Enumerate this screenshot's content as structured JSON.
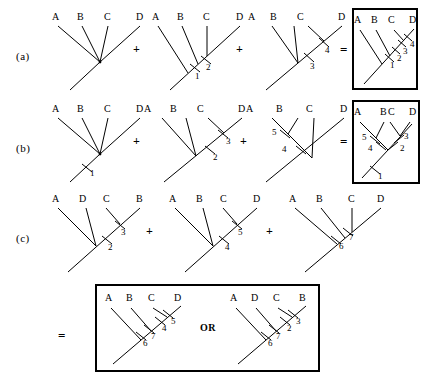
{
  "figure": {
    "rows": [
      {
        "id": "a",
        "label": "(a)",
        "operators": [
          "+",
          "+",
          "="
        ],
        "trees": [
          {
            "name": "row-a-tree-1",
            "leaves": [
              "A",
              "B",
              "C",
              "D"
            ],
            "marks": [],
            "boxed": false
          },
          {
            "name": "row-a-tree-2",
            "leaves": [
              "A",
              "B",
              "C",
              "D"
            ],
            "marks": [
              "1",
              "2"
            ],
            "boxed": false
          },
          {
            "name": "row-a-tree-3",
            "leaves": [
              "A",
              "B",
              "C",
              "D"
            ],
            "marks": [
              "3",
              "4"
            ],
            "boxed": false
          },
          {
            "name": "row-a-result",
            "leaves": [
              "A",
              "B",
              "C",
              "D"
            ],
            "marks": [
              "1",
              "2",
              "3",
              "4"
            ],
            "boxed": true
          }
        ]
      },
      {
        "id": "b",
        "label": "(b)",
        "operators": [
          "+",
          "+",
          "="
        ],
        "trees": [
          {
            "name": "row-b-tree-1",
            "leaves": [
              "A",
              "B",
              "C",
              "D"
            ],
            "marks": [
              "1"
            ],
            "boxed": false
          },
          {
            "name": "row-b-tree-2",
            "leaves": [
              "A",
              "B",
              "C",
              "D"
            ],
            "marks": [
              "2",
              "3"
            ],
            "boxed": false
          },
          {
            "name": "row-b-tree-3",
            "leaves": [
              "A",
              "B",
              "C",
              "D"
            ],
            "marks": [
              "4",
              "5"
            ],
            "boxed": false
          },
          {
            "name": "row-b-result",
            "leaves": [
              "A",
              "B",
              "C",
              "D"
            ],
            "marks": [
              "1",
              "2",
              "3",
              "4",
              "5"
            ],
            "boxed": true
          }
        ]
      },
      {
        "id": "c",
        "label": "(c)",
        "operators": [
          "+",
          "+"
        ],
        "trees": [
          {
            "name": "row-c-tree-1",
            "leaves": [
              "A",
              "D",
              "C",
              "B"
            ],
            "marks": [
              "2",
              "3"
            ],
            "boxed": false
          },
          {
            "name": "row-c-tree-2",
            "leaves": [
              "A",
              "B",
              "C",
              "D"
            ],
            "marks": [
              "4",
              "5"
            ],
            "boxed": false
          },
          {
            "name": "row-c-tree-3",
            "leaves": [
              "A",
              "B",
              "C",
              "D"
            ],
            "marks": [
              "6",
              "7"
            ],
            "boxed": false
          }
        ]
      }
    ],
    "result_row": {
      "id": "c-result",
      "operator": "=",
      "or_text": "OR",
      "trees": [
        {
          "name": "result-tree-left",
          "leaves": [
            "A",
            "B",
            "C",
            "D"
          ],
          "marks": [
            "6",
            "7",
            "4",
            "5"
          ],
          "boxed": true
        },
        {
          "name": "result-tree-right",
          "leaves": [
            "A",
            "D",
            "C",
            "B"
          ],
          "marks": [
            "6",
            "7",
            "2",
            "3"
          ],
          "boxed": true
        }
      ]
    },
    "colors": {
      "ink": "#000000",
      "background": "#ffffff",
      "box_border": "#000000"
    }
  }
}
